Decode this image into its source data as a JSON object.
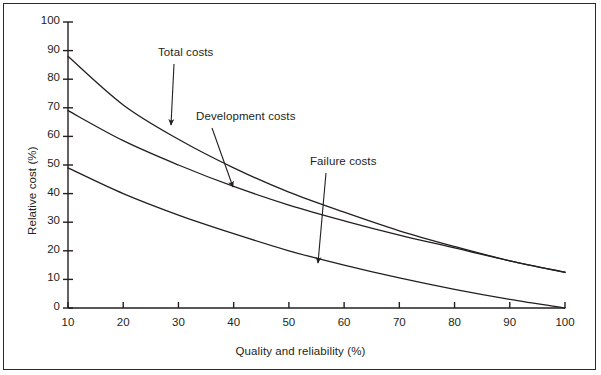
{
  "chart_data": {
    "type": "line",
    "title": "",
    "xlabel": "Quality and reliability (%)",
    "ylabel": "Relative cost (%)",
    "xlim": [
      10,
      100
    ],
    "ylim": [
      0,
      100
    ],
    "xticks": [
      10,
      20,
      30,
      40,
      50,
      60,
      70,
      80,
      90,
      100
    ],
    "yticks": [
      0,
      10,
      20,
      30,
      40,
      50,
      60,
      70,
      80,
      90,
      100
    ],
    "grid": false,
    "legend_position": "annotations-on-curves",
    "x": [
      10,
      20,
      30,
      40,
      50,
      60,
      70,
      80,
      90,
      100
    ],
    "series": [
      {
        "name": "Total costs",
        "values": [
          88,
          71,
          59,
          49,
          40.5,
          33.5,
          27,
          21.5,
          16.5,
          12.5
        ]
      },
      {
        "name": "Development costs",
        "values": [
          69,
          58.5,
          50,
          42.5,
          36,
          30.5,
          25.5,
          21,
          16.5,
          12.5
        ]
      },
      {
        "name": "Failure costs",
        "values": [
          49,
          40,
          32.5,
          26,
          20,
          15,
          10.5,
          6.5,
          3,
          0
        ]
      }
    ],
    "annotations": [
      {
        "text": "Total costs",
        "label_x": 158,
        "label_y": 46,
        "tip_x": 171,
        "tip_y": 125
      },
      {
        "text": "Development costs",
        "label_x": 196,
        "label_y": 110,
        "tip_x": 233,
        "tip_y": 187
      },
      {
        "text": "Failure costs",
        "label_x": 310,
        "label_y": 155,
        "tip_x": 318,
        "tip_y": 263
      }
    ],
    "colors": {
      "line": "#231f20",
      "axis": "#231f20",
      "border": "#2b2b2b",
      "background": "#ffffff"
    }
  }
}
